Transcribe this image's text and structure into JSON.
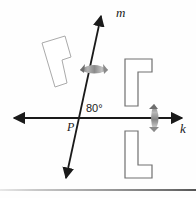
{
  "figure": {
    "kind": "geometry-diagram",
    "background_color": "#fefefe",
    "lines": [
      {
        "id": "line-m",
        "label": "m",
        "label_x": 116,
        "label_y": 17,
        "x1": 66,
        "y1": 178,
        "x2": 101,
        "y2": 16,
        "color": "#1a1a1a",
        "double_arrow": true
      },
      {
        "id": "line-k",
        "label": "k",
        "label_x": 180,
        "label_y": 133,
        "x1": 14,
        "y1": 118,
        "x2": 182,
        "y2": 118,
        "color": "#1a1a1a",
        "double_arrow": true
      }
    ],
    "points": [
      {
        "id": "point-p",
        "label": "P",
        "x": 78,
        "y": 118,
        "label_x": 67,
        "label_y": 131
      }
    ],
    "angles": [
      {
        "id": "angle-at-p",
        "value": "80°",
        "label_x": 86,
        "label_y": 112,
        "vertex": "P",
        "between": [
          "m",
          "k"
        ]
      }
    ],
    "shapes": [
      {
        "id": "shape-left-rotated-l",
        "name": "rotated-l-shape-left",
        "stroke": "#aaaaaa",
        "fill": "#ffffff",
        "stroke_width": 1,
        "points": "42,43 65,36 71,57 62,60 67,83 55,87 42,43"
      },
      {
        "id": "shape-top-right-l",
        "name": "l-shape-upper-right",
        "stroke": "#707070",
        "fill": "#ffffff",
        "stroke_width": 1.2,
        "points": "125,59 152,59 152,72 138,72 138,106 125,106"
      },
      {
        "id": "shape-bottom-right-l",
        "name": "l-shape-lower-right",
        "stroke": "#707070",
        "fill": "#ffffff",
        "stroke_width": 1.2,
        "points": "125,131 138,131 138,165 152,165 152,178 125,178"
      }
    ],
    "reflection_arrows": [
      {
        "id": "arrow-across-m",
        "name": "reflection-arrow-across-line-m",
        "orientation": "horizontal",
        "color": "#8c8c8c",
        "cx": 94,
        "cy": 70
      },
      {
        "id": "arrow-across-k",
        "name": "reflection-arrow-across-line-k",
        "orientation": "vertical",
        "color": "#8c8c8c",
        "cx": 154,
        "cy": 118
      }
    ],
    "page_edge": {
      "name": "page-bottom-edge",
      "y": 189
    }
  }
}
